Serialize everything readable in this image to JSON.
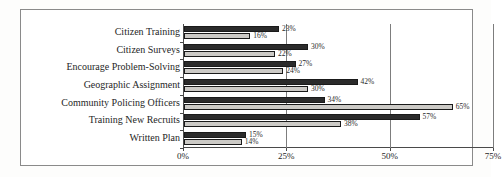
{
  "chart_data": {
    "type": "bar",
    "orientation": "horizontal",
    "title": "",
    "xlabel": "",
    "ylabel": "",
    "xlim": [
      0,
      75
    ],
    "xticks": [
      "0%",
      "25%",
      "50%",
      "75%"
    ],
    "xtick_values": [
      0,
      25,
      50,
      75
    ],
    "grid": true,
    "legend": "none",
    "categories": [
      "Citizen Training",
      "Citizen Surveys",
      "Encourage Problem-Solving",
      "Geographic Assignment",
      "Community Policing Officers",
      "Training New Recruits",
      "Written Plan"
    ],
    "series": [
      {
        "name": "series-1",
        "color": "#2b2b2b",
        "values": [
          23,
          30,
          27,
          42,
          34,
          57,
          15
        ],
        "labels": [
          "23%",
          "30%",
          "27%",
          "42%",
          "34%",
          "57%",
          "15%"
        ]
      },
      {
        "name": "series-2",
        "color": "#cccac6",
        "values": [
          16,
          22,
          24,
          30,
          65,
          38,
          14
        ],
        "labels": [
          "16%",
          "22%",
          "24%",
          "30%",
          "65%",
          "38%",
          "14%"
        ]
      }
    ]
  }
}
